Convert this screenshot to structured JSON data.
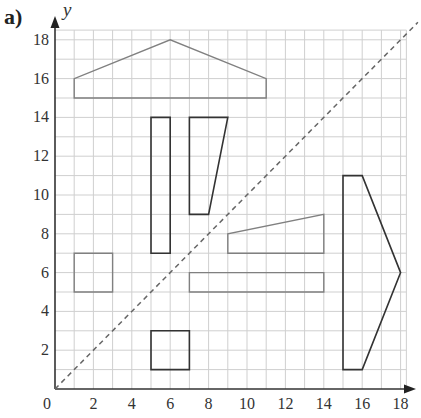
{
  "part_label": "a)",
  "axes": {
    "x_label": "x",
    "y_label": "y",
    "origin_label": "0",
    "x_ticks": [
      "2",
      "4",
      "6",
      "8",
      "10",
      "12",
      "14",
      "16",
      "18"
    ],
    "y_ticks": [
      "2",
      "4",
      "6",
      "8",
      "10",
      "12",
      "14",
      "16",
      "18"
    ],
    "x_range": [
      0,
      18
    ],
    "y_range": [
      0,
      18
    ]
  },
  "mirror_line": {
    "equation": "y = x",
    "style": "dashed",
    "color": "#666666"
  },
  "shapes": [
    {
      "name": "roof-shape",
      "points": [
        [
          1,
          15
        ],
        [
          1,
          16
        ],
        [
          6,
          18
        ],
        [
          11,
          16
        ],
        [
          11,
          15
        ]
      ],
      "color": "#808080",
      "width": 1.4
    },
    {
      "name": "tall-rectangle",
      "points": [
        [
          5,
          7
        ],
        [
          5,
          14
        ],
        [
          6,
          14
        ],
        [
          6,
          7
        ]
      ],
      "color": "#333333",
      "width": 1.6
    },
    {
      "name": "tall-trapezoid",
      "points": [
        [
          7,
          9
        ],
        [
          7,
          14
        ],
        [
          9,
          14
        ],
        [
          8,
          9
        ]
      ],
      "color": "#333333",
      "width": 1.6
    },
    {
      "name": "left-square",
      "points": [
        [
          1,
          5
        ],
        [
          1,
          7
        ],
        [
          3,
          7
        ],
        [
          3,
          5
        ]
      ],
      "color": "#808080",
      "width": 1.4
    },
    {
      "name": "wedge-shape",
      "points": [
        [
          9,
          7
        ],
        [
          9,
          8
        ],
        [
          14,
          9
        ],
        [
          14,
          7
        ]
      ],
      "color": "#808080",
      "width": 1.4
    },
    {
      "name": "long-rectangle",
      "points": [
        [
          7,
          5
        ],
        [
          7,
          6
        ],
        [
          14,
          6
        ],
        [
          14,
          5
        ]
      ],
      "color": "#808080",
      "width": 1.4
    },
    {
      "name": "bottom-square",
      "points": [
        [
          5,
          1
        ],
        [
          5,
          3
        ],
        [
          7,
          3
        ],
        [
          7,
          1
        ]
      ],
      "color": "#333333",
      "width": 1.6
    },
    {
      "name": "arrow-shape",
      "points": [
        [
          15,
          1
        ],
        [
          15,
          11
        ],
        [
          16,
          11
        ],
        [
          18,
          6
        ],
        [
          16,
          1
        ]
      ],
      "color": "#333333",
      "width": 1.6
    }
  ]
}
